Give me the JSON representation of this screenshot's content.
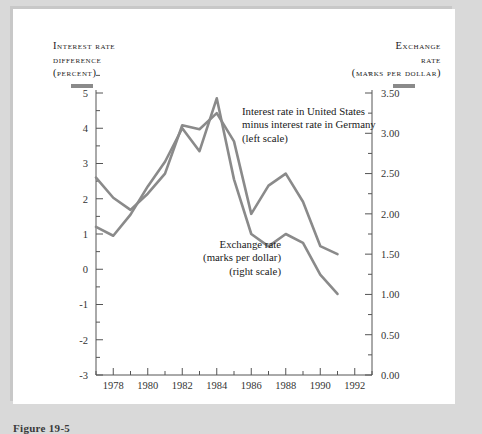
{
  "figure": {
    "caption": "Figure 19-5",
    "left_axis_title": [
      "Interest rate",
      "difference",
      "(percent)"
    ],
    "right_axis_title": [
      "Exchange",
      "rate",
      "(marks per dollar)"
    ],
    "left_key_color": "#8a8a8a",
    "right_key_color": "#8a8a8a"
  },
  "chart_data": {
    "type": "line",
    "title": "",
    "xlabel": "",
    "ylabel": "Interest rate difference (percent)",
    "y2label": "Exchange rate (marks per dollar)",
    "grid": false,
    "legend_position": "inline-annotations",
    "xlim": [
      1977,
      1993
    ],
    "xticks": [
      1978,
      1980,
      1982,
      1984,
      1986,
      1988,
      1990,
      1992
    ],
    "xtick_labels": [
      "1978",
      "1980",
      "1982",
      "1984",
      "1986",
      "1988",
      "1990",
      "1992"
    ],
    "x_minor_ticks": [
      1977,
      1979,
      1981,
      1983,
      1985,
      1987,
      1989,
      1991,
      1993
    ],
    "ylim": [
      -3,
      5
    ],
    "yticks": [
      -3,
      -2,
      -1,
      0,
      1,
      2,
      3,
      4,
      5
    ],
    "ytick_labels": [
      "-3",
      "-2",
      "-1",
      "0",
      "1",
      "2",
      "3",
      "4",
      "5"
    ],
    "y2lim": [
      0.0,
      3.5
    ],
    "y2ticks": [
      0.0,
      0.5,
      1.0,
      1.5,
      2.0,
      2.5,
      3.0,
      3.5
    ],
    "y2tick_labels": [
      "0.00",
      "0.50",
      "1.00",
      "1.50",
      "2.00",
      "2.50",
      "3.00",
      "3.50"
    ],
    "y2_minor_ticks": [
      0.25,
      0.75,
      1.25,
      1.75,
      2.25,
      2.75,
      3.25
    ],
    "x": [
      1977,
      1978,
      1979,
      1980,
      1981,
      1982,
      1983,
      1984,
      1985,
      1986,
      1987,
      1988,
      1989,
      1990,
      1991
    ],
    "series": [
      {
        "name": "Interest rate in United States minus interest rate in Germany",
        "axis": "left",
        "color": "#8a8a8a",
        "annotation": [
          "Interest rate in United States",
          "minus interest rate in Germany",
          "(left scale)"
        ],
        "values": [
          1.2,
          0.95,
          1.55,
          2.35,
          3.05,
          4.0,
          3.35,
          4.85,
          2.55,
          1.0,
          0.65,
          1.0,
          0.75,
          -0.15,
          -0.7
        ]
      },
      {
        "name": "Exchange rate (marks per dollar)",
        "axis": "right",
        "color": "#8a8a8a",
        "annotation": [
          "Exchange rate",
          "(marks per dollar)",
          "(right scale)"
        ],
        "values": [
          2.45,
          2.2,
          2.05,
          2.25,
          2.5,
          3.1,
          3.05,
          3.25,
          2.9,
          2.0,
          2.35,
          2.5,
          2.15,
          1.6,
          1.5
        ]
      }
    ]
  }
}
